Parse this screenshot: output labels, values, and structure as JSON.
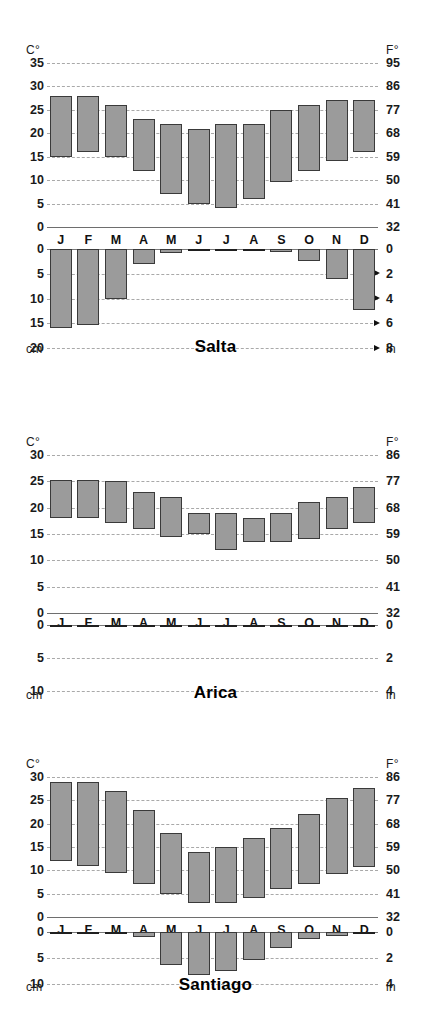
{
  "figure": {
    "kind": "climate-chart-set",
    "units": {
      "temp_left": "C°",
      "temp_right": "F°",
      "precip_left": "cm",
      "precip_right": "in"
    },
    "months": [
      "J",
      "F",
      "M",
      "A",
      "M",
      "J",
      "J",
      "A",
      "S",
      "O",
      "N",
      "D"
    ],
    "bar_fill": "#9b9b9b",
    "bar_stroke": "#3a3a3a",
    "grid_color": "#a9a9a9",
    "axis_color": "#6e6e6e"
  },
  "chart_data": [
    {
      "type": "bar",
      "title": "Salta",
      "subtype": "climograph",
      "categories": [
        "J",
        "F",
        "M",
        "A",
        "M",
        "J",
        "J",
        "A",
        "S",
        "O",
        "N",
        "D"
      ],
      "temperature": {
        "ylabel": "C°",
        "ylabel_right": "F°",
        "ylim": [
          0,
          35
        ],
        "ticks_c": [
          0,
          5,
          10,
          15,
          20,
          25,
          30,
          35
        ],
        "ticks_f": [
          32,
          41,
          50,
          59,
          68,
          77,
          86,
          95
        ],
        "grid": true,
        "series": [
          {
            "name": "Temperature range (min–max °C)",
            "min": [
              15,
              16,
              15,
              12,
              7,
              5,
              4,
              6,
              9.5,
              12,
              14,
              16
            ],
            "max": [
              28,
              28,
              26,
              23,
              22,
              21,
              22,
              22,
              25,
              26,
              27,
              27
            ]
          }
        ]
      },
      "precipitation": {
        "ylabel": "cm",
        "ylabel_right": "in",
        "ylim": [
          0,
          20
        ],
        "ticks_cm": [
          0,
          5,
          10,
          15,
          20
        ],
        "ticks_in": [
          0,
          2,
          4,
          6,
          8
        ],
        "grid": true,
        "arrows_at_cm": [
          5,
          10,
          15,
          20
        ],
        "values_cm": [
          16,
          15.3,
          10,
          3,
          0.8,
          0.3,
          0.3,
          0.5,
          0.7,
          2.4,
          6,
          12.3
        ]
      }
    },
    {
      "type": "bar",
      "title": "Arica",
      "subtype": "climograph",
      "categories": [
        "J",
        "F",
        "M",
        "A",
        "M",
        "J",
        "J",
        "A",
        "S",
        "O",
        "N",
        "D"
      ],
      "temperature": {
        "ylabel": "C°",
        "ylabel_right": "F°",
        "ylim": [
          0,
          30
        ],
        "ticks_c": [
          0,
          5,
          10,
          15,
          20,
          25,
          30
        ],
        "ticks_f": [
          32,
          41,
          50,
          59,
          68,
          77,
          86
        ],
        "grid": true,
        "series": [
          {
            "name": "Temperature range (min–max °C)",
            "min": [
              18,
              18,
              17,
              16,
              14.5,
              15,
              12,
              13.5,
              13.5,
              14,
              16,
              17
            ],
            "max": [
              25.3,
              25.3,
              25,
              23,
              22,
              19,
              19,
              18,
              19,
              21,
              22,
              24
            ]
          }
        ]
      },
      "precipitation": {
        "ylabel": "cm",
        "ylabel_right": "in",
        "ylim": [
          0,
          10
        ],
        "ticks_cm": [
          0,
          5,
          10
        ],
        "ticks_in": [
          0,
          2,
          4
        ],
        "grid": true,
        "arrows_at_cm": [],
        "values_cm": [
          0.15,
          0.02,
          0.02,
          0.02,
          0.02,
          0.02,
          0.02,
          0.15,
          0.02,
          0.02,
          0.02,
          0.15
        ]
      }
    },
    {
      "type": "bar",
      "title": "Santiago",
      "subtype": "climograph",
      "categories": [
        "J",
        "F",
        "M",
        "A",
        "M",
        "J",
        "J",
        "A",
        "S",
        "O",
        "N",
        "D"
      ],
      "temperature": {
        "ylabel": "C°",
        "ylabel_right": "F°",
        "ylim": [
          0,
          30
        ],
        "ticks_c": [
          0,
          5,
          10,
          15,
          20,
          25,
          30
        ],
        "ticks_f": [
          32,
          41,
          50,
          59,
          68,
          77,
          86
        ],
        "grid": true,
        "series": [
          {
            "name": "Temperature range (min–max °C)",
            "min": [
              12,
              11,
              9.5,
              7,
              5,
              3,
              3,
              4,
              6,
              7,
              9.3,
              10.7
            ],
            "max": [
              29,
              29,
              27,
              23,
              18,
              14,
              15,
              17,
              19,
              22,
              25.5,
              27.7
            ]
          }
        ]
      },
      "precipitation": {
        "ylabel": "cm",
        "ylabel_right": "in",
        "ylim": [
          0,
          10
        ],
        "ticks_cm": [
          0,
          5,
          10
        ],
        "ticks_in": [
          0,
          2,
          4
        ],
        "grid": true,
        "arrows_at_cm": [],
        "values_cm": [
          0.2,
          0.2,
          0.3,
          0.9,
          6.3,
          8.2,
          7.5,
          5.3,
          3.1,
          1.3,
          0.7,
          0.4
        ]
      }
    }
  ]
}
